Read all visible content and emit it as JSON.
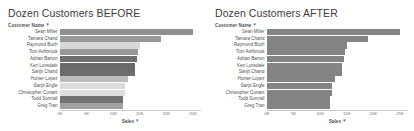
{
  "panels": [
    {
      "title": "Dozen Customers BEFORE",
      "field_header": "Customer Name",
      "sort_glyph": "▼",
      "axis_title": "Sales",
      "axis_sort_glyph": "▼"
    },
    {
      "title": "Dozen Customers AFTER",
      "field_header": "Customer Name",
      "sort_glyph": "▼",
      "axis_title": "Sales",
      "axis_sort_glyph": "▼"
    }
  ],
  "chart_data": [
    {
      "type": "bar",
      "orientation": "horizontal",
      "title": "Dozen Customers BEFORE",
      "xlabel": "Sales",
      "ylabel": "Customer Name",
      "xlim": [
        0,
        26500
      ],
      "ticks": [
        0,
        5000,
        10000,
        15000,
        20000,
        25000
      ],
      "tick_labels": [
        "0K",
        "5K",
        "10K",
        "15K",
        "20K",
        "25K"
      ],
      "grid": false,
      "legend": "none",
      "categories": [
        "Sean Miller",
        "Tamara Chand",
        "Raymond Buch",
        "Tom Ashbrook",
        "Adrian Barton",
        "Ken Lonsdale",
        "Sanjit Chand",
        "Hunter Lopez",
        "Sanjit Engle",
        "Christopher Conant",
        "Todd Sumrall",
        "Greg Tran"
      ],
      "values": [
        25043,
        19052,
        15117,
        14596,
        14474,
        14175,
        14142,
        12873,
        12209,
        12129,
        11891,
        11820
      ],
      "bar_colors": [
        "#8f8f8f",
        "#989898",
        "#d8d8d8",
        "#989898",
        "#6f6f6f",
        "#6a6a6a",
        "#6c6c6c",
        "#bdbdbd",
        "#dcdcdc",
        "#dedede",
        "#727272",
        "#a0a0a0"
      ]
    },
    {
      "type": "bar",
      "orientation": "horizontal",
      "title": "Dozen Customers AFTER",
      "xlabel": "Sales",
      "ylabel": "Customer Name",
      "xlim": [
        0,
        26500
      ],
      "ticks": [
        0,
        5000,
        10000,
        15000,
        20000,
        25000
      ],
      "tick_labels": [
        "0K",
        "5K",
        "10K",
        "15K",
        "20K",
        "25K"
      ],
      "grid": false,
      "legend": "none",
      "categories": [
        "Sean Miller",
        "Tamara Chand",
        "Raymond Buch",
        "Tom Ashbrook",
        "Adrian Barton",
        "Ken Lonsdale",
        "Sanjit Chand",
        "Hunter Lopez",
        "Sanjit Engle",
        "Christopher Conant",
        "Todd Sumrall",
        "Greg Tran"
      ],
      "values": [
        25043,
        19052,
        15117,
        14596,
        14474,
        14175,
        14142,
        12873,
        12209,
        12129,
        11891,
        11820
      ],
      "bar_colors": [
        "#848484",
        "#848484",
        "#848484",
        "#848484",
        "#848484",
        "#848484",
        "#848484",
        "#848484",
        "#848484",
        "#848484",
        "#848484",
        "#848484"
      ]
    }
  ]
}
